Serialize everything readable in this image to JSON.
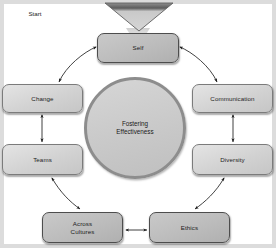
{
  "diagram": {
    "title": "Fostering Effectiveness",
    "type": "cycle-diagram",
    "center": {
      "label": "Fostering\nEffectiveness",
      "shape": "circle"
    },
    "start_marker": {
      "label": "Start",
      "shape": "down-triangle"
    },
    "nodes": [
      {
        "id": "self",
        "label": "Self",
        "shape": "rounded-rect",
        "tone": "dark",
        "position": "top"
      },
      {
        "id": "communication",
        "label": "Communication",
        "shape": "rounded-rect",
        "tone": "light",
        "position": "right-upper"
      },
      {
        "id": "diversity",
        "label": "Diversity",
        "shape": "rounded-rect",
        "tone": "light",
        "position": "right-lower"
      },
      {
        "id": "ethics",
        "label": "Ethics",
        "shape": "rounded-rect",
        "tone": "dark",
        "position": "bottom-right"
      },
      {
        "id": "across-cultures",
        "label": "Across\nCultures",
        "shape": "rounded-rect",
        "tone": "dark",
        "position": "bottom-left"
      },
      {
        "id": "teams",
        "label": "Teams",
        "shape": "rounded-rect",
        "tone": "light",
        "position": "left-lower"
      },
      {
        "id": "change",
        "label": "Change",
        "shape": "rounded-rect",
        "tone": "light",
        "position": "left-upper"
      }
    ],
    "connectors": [
      {
        "from": "start",
        "to": "self",
        "style": "funnel",
        "arrow": "single"
      },
      {
        "from": "self",
        "to": "change",
        "style": "curved",
        "arrow": "double"
      },
      {
        "from": "self",
        "to": "communication",
        "style": "curved",
        "arrow": "double"
      },
      {
        "from": "change",
        "to": "teams",
        "style": "straight-vertical",
        "arrow": "double"
      },
      {
        "from": "communication",
        "to": "diversity",
        "style": "straight-vertical",
        "arrow": "double"
      },
      {
        "from": "teams",
        "to": "across-cultures",
        "style": "curved",
        "arrow": "double"
      },
      {
        "from": "diversity",
        "to": "ethics",
        "style": "curved",
        "arrow": "double"
      },
      {
        "from": "across-cultures",
        "to": "ethics",
        "style": "straight-horizontal",
        "arrow": "double"
      }
    ],
    "colors": {
      "background": "#dcdcdc",
      "node_light_fill": "#d9d9d9",
      "node_dark_fill": "#c2c2c2",
      "node_border": "#6e6e6e",
      "node_dark_border": "#4d4d4d",
      "circle_fill": "#cccccc",
      "circle_border": "#8d8d8d",
      "arrow": "#2b2b2b",
      "text": "#1c1c1c"
    }
  }
}
